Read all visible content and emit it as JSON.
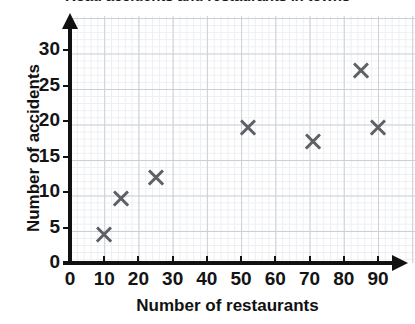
{
  "chart_data": {
    "type": "scatter",
    "title": "Road accidents and restaurants in towns",
    "xlabel": "Number of restaurants",
    "ylabel": "Number of accidents",
    "xlim": [
      0,
      100
    ],
    "ylim": [
      0,
      32
    ],
    "xticks": [
      0,
      10,
      20,
      30,
      40,
      50,
      60,
      70,
      80,
      90
    ],
    "yticks": [
      0,
      5,
      10,
      15,
      20,
      25,
      30
    ],
    "grid": true,
    "minor_grid": true,
    "legend": null,
    "marker": "x",
    "marker_color": "#5e6066",
    "points": [
      {
        "x": 10,
        "y": 4
      },
      {
        "x": 15,
        "y": 9
      },
      {
        "x": 25,
        "y": 12
      },
      {
        "x": 52,
        "y": 19
      },
      {
        "x": 71,
        "y": 17
      },
      {
        "x": 85,
        "y": 27
      },
      {
        "x": 90,
        "y": 19
      }
    ]
  },
  "colors": {
    "axis": "#111111",
    "marker": "#5e6066",
    "major_grid": "#c9cdd6",
    "minor_grid": "#eceef2",
    "background": "#ffffff",
    "text": "#141414"
  }
}
